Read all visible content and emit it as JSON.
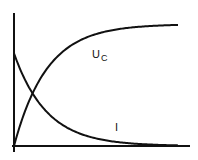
{
  "chart_data": {
    "type": "line",
    "title": "",
    "xlabel": "",
    "ylabel": "",
    "grid": false,
    "legend": "none",
    "x_range": [
      0,
      5
    ],
    "y_range": [
      0,
      1.05
    ],
    "time_constant": 1,
    "series": [
      {
        "name": "Uc",
        "label_main": "U",
        "label_sub": "C",
        "function": "1 - exp(-t/tau)",
        "x": [
          0,
          0.5,
          1,
          1.5,
          2,
          2.5,
          3,
          3.5,
          4,
          4.5,
          5
        ],
        "values": [
          0,
          0.39,
          0.63,
          0.78,
          0.86,
          0.92,
          0.95,
          0.97,
          0.98,
          0.99,
          0.99
        ]
      },
      {
        "name": "I",
        "label_main": "I",
        "label_sub": "",
        "function": "0.76 * exp(-t/tau)",
        "x": [
          0,
          0.5,
          1,
          1.5,
          2,
          2.5,
          3,
          3.5,
          4,
          4.5,
          5
        ],
        "values": [
          0.76,
          0.46,
          0.28,
          0.17,
          0.1,
          0.06,
          0.04,
          0.02,
          0.01,
          0.01,
          0.01
        ]
      }
    ]
  }
}
